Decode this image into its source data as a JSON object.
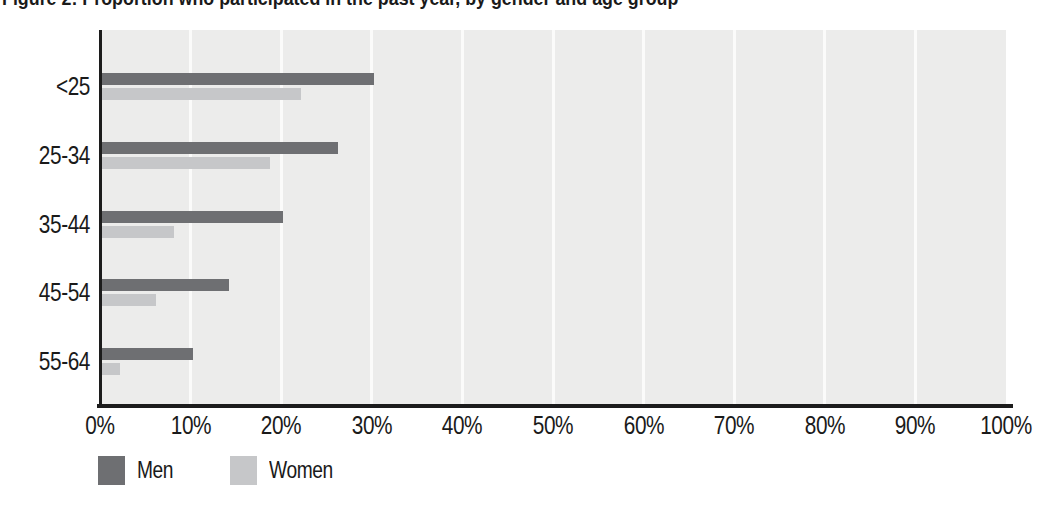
{
  "title": "Figure 2: Proportion who participated in the past year, by gender and age group",
  "chart_data": {
    "type": "bar",
    "orientation": "horizontal",
    "title": "Figure 2: Proportion who participated in the past year, by gender and age group",
    "categories": [
      "<25",
      "25-34",
      "35-44",
      "45-54",
      "55-64"
    ],
    "series": [
      {
        "name": "Men",
        "color": "#6e6f72",
        "values": [
          30,
          26,
          20,
          14,
          10
        ]
      },
      {
        "name": "Women",
        "color": "#c6c7c9",
        "values": [
          22,
          18.5,
          8,
          6,
          2
        ]
      }
    ],
    "x_ticks": [
      "0%",
      "10%",
      "20%",
      "30%",
      "40%",
      "50%",
      "60%",
      "70%",
      "80%",
      "90%",
      "100%"
    ],
    "xlim": [
      0,
      100
    ],
    "xlabel": "",
    "ylabel": "",
    "grid": "vertical-white-gridlines-every-10pct",
    "legend_position": "bottom-left",
    "plot_bg": "#ececeb",
    "gridline_color": "#fbfbfa",
    "axis_color": "#1c1c1c"
  }
}
